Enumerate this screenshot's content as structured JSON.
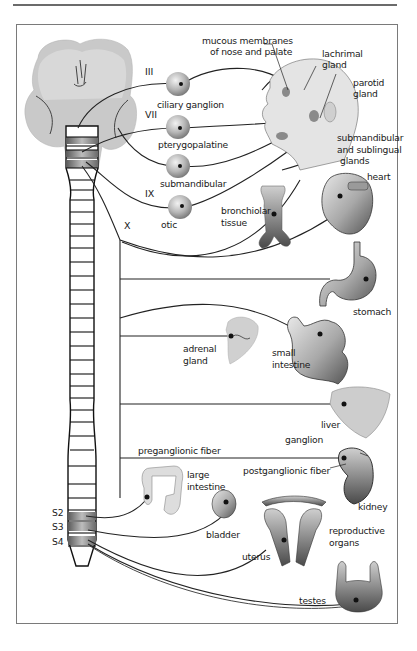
{
  "figure": {
    "cranial_nerves": [
      "III",
      "VII",
      "IX",
      "X"
    ],
    "sacral_segments": [
      "S2",
      "S3",
      "S4"
    ],
    "ganglia": {
      "ciliary": "ciliary ganglion",
      "pterygopalatine": "pterygopalatine",
      "submandibular": "submandibular",
      "otic": "otic"
    },
    "targets": {
      "mucous_line1": "mucous membranes",
      "mucous_line2": "of nose and palate",
      "lachrimal_line1": "lachrimal",
      "lachrimal_line2": "gland",
      "parotid_line1": "parotid",
      "parotid_line2": "gland",
      "subsub_line1": "submandibular",
      "subsub_line2": "and sublingual",
      "subsub_line3": "glands",
      "heart": "heart",
      "bronch_line1": "bronchiolar",
      "bronch_line2": "tissue",
      "stomach": "stomach",
      "adrenal_line1": "adrenal",
      "adrenal_line2": "gland",
      "small_int_line1": "small",
      "small_int_line2": "intestine",
      "liver": "liver",
      "ganglion": "ganglion",
      "preganglionic": "preganglionic fiber",
      "postganglionic": "postganglionic fiber",
      "kidney": "kidney",
      "large_int_line1": "large",
      "large_int_line2": "intestine",
      "bladder": "bladder",
      "repro_line1": "reproductive",
      "repro_line2": "organs",
      "uterus": "uterus",
      "testes": "testes"
    },
    "colors": {
      "line": "#222222",
      "organ_gray": "#9a9a9a",
      "light_gray": "#d4d4d4",
      "frame": "#7a7a7a"
    }
  }
}
